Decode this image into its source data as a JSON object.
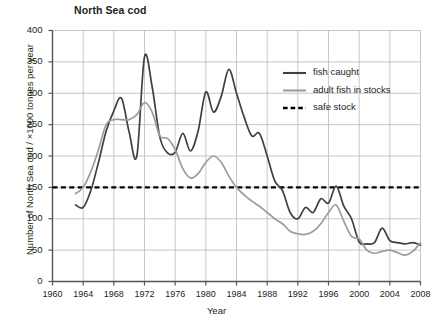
{
  "chart_data": {
    "type": "line",
    "title": "North Sea cod",
    "xlabel": "Year",
    "ylabel": "Number of North Sea cod / ×1000 tonnes per year",
    "xlim": [
      1960,
      2008
    ],
    "ylim": [
      0,
      400
    ],
    "xticks": [
      1960,
      1964,
      1968,
      1972,
      1976,
      1980,
      1984,
      1988,
      1992,
      1996,
      2000,
      2004,
      2008
    ],
    "yticks": [
      0,
      50,
      100,
      150,
      200,
      250,
      300,
      350,
      400
    ],
    "grid": true,
    "legend_position": "top-right",
    "series": [
      {
        "name": "fish caught",
        "color": "#3f3f3f",
        "style": "solid",
        "x": [
          1963,
          1964,
          1965,
          1966,
          1967,
          1968,
          1969,
          1970,
          1971,
          1972,
          1973,
          1974,
          1975,
          1976,
          1977,
          1978,
          1979,
          1980,
          1981,
          1982,
          1983,
          1984,
          1985,
          1986,
          1987,
          1988,
          1989,
          1990,
          1991,
          1992,
          1993,
          1994,
          1995,
          1996,
          1997,
          1998,
          1999,
          2000,
          2001,
          2002,
          2003,
          2004,
          2005,
          2006,
          2007,
          2008
        ],
        "values": [
          122,
          118,
          145,
          190,
          240,
          272,
          292,
          238,
          200,
          358,
          310,
          230,
          205,
          206,
          236,
          208,
          240,
          302,
          270,
          295,
          338,
          300,
          262,
          232,
          236,
          200,
          160,
          145,
          110,
          100,
          118,
          110,
          132,
          125,
          152,
          120,
          100,
          63,
          60,
          62,
          85,
          65,
          62,
          60,
          62,
          58
        ]
      },
      {
        "name": "adult fish in stocks",
        "color": "#9c9c9c",
        "style": "solid",
        "x": [
          1963,
          1964,
          1965,
          1966,
          1967,
          1968,
          1969,
          1970,
          1971,
          1972,
          1973,
          1974,
          1975,
          1976,
          1977,
          1978,
          1979,
          1980,
          1981,
          1982,
          1983,
          1984,
          1985,
          1986,
          1987,
          1988,
          1989,
          1990,
          1991,
          1992,
          1993,
          1994,
          1995,
          1996,
          1997,
          1998,
          1999,
          2000,
          2001,
          2002,
          2003,
          2004,
          2005,
          2006,
          2007,
          2008
        ],
        "values": [
          140,
          150,
          175,
          210,
          250,
          258,
          258,
          258,
          266,
          285,
          270,
          232,
          228,
          210,
          180,
          165,
          172,
          190,
          200,
          190,
          168,
          150,
          138,
          128,
          120,
          110,
          100,
          92,
          80,
          76,
          75,
          80,
          92,
          110,
          122,
          96,
          72,
          68,
          50,
          45,
          48,
          50,
          46,
          42,
          48,
          62
        ]
      }
    ],
    "reference_line": {
      "name": "safe stock",
      "value": 150,
      "color": "#000000",
      "style": "dashed"
    }
  },
  "legend": {
    "items": [
      {
        "label": "fish caught"
      },
      {
        "label": "adult fish in stocks"
      },
      {
        "label": "safe stock"
      }
    ]
  }
}
